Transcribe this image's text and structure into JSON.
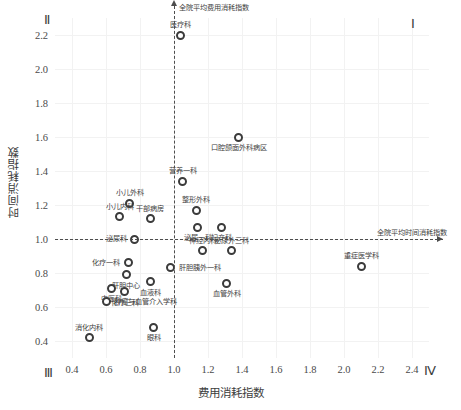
{
  "chart_data": {
    "type": "scatter",
    "title": "",
    "xlabel": "费用消耗指数",
    "ylabel": "时间消耗指数",
    "xlim": [
      0.3,
      2.5
    ],
    "ylim": [
      0.3,
      2.3
    ],
    "xticks": [
      "0.4",
      "0.6",
      "0.8",
      "1.0",
      "1.2",
      "1.4",
      "1.6",
      "1.8",
      "2.0",
      "2.2",
      "2.4"
    ],
    "xtickvalues": [
      0.4,
      0.6,
      0.8,
      1.0,
      1.2,
      1.4,
      1.6,
      1.8,
      2.0,
      2.2,
      2.4
    ],
    "yticks": [
      "0.4",
      "0.6",
      "0.8",
      "1.0",
      "1.2",
      "1.4",
      "1.6",
      "1.8",
      "2.0",
      "2.2"
    ],
    "ytickvalues": [
      0.4,
      0.6,
      0.8,
      1.0,
      1.2,
      1.4,
      1.6,
      1.8,
      2.0,
      2.2
    ],
    "grid": true,
    "legend": "none",
    "reference_lines": {
      "vertical_x": 1.0,
      "vertical_label": "全院平均费用消耗指数",
      "horizontal_y": 1.0,
      "horizontal_label": "全院平均时间消耗指数"
    },
    "quadrant_labels": {
      "top_left": "Ⅱ",
      "top_right": "Ⅰ",
      "bottom_left": "Ⅲ",
      "bottom_right": "Ⅳ"
    },
    "points": [
      {
        "label": "医疗科",
        "x": 1.04,
        "y": 2.2,
        "pos": "above"
      },
      {
        "label": "口腔颌面外科病区",
        "x": 1.38,
        "y": 1.6,
        "pos": "below"
      },
      {
        "label": "营养一科",
        "x": 1.05,
        "y": 1.34,
        "pos": "above"
      },
      {
        "label": "小儿外科",
        "x": 0.74,
        "y": 1.21,
        "pos": "above"
      },
      {
        "label": "整形外科",
        "x": 1.13,
        "y": 1.17,
        "pos": "above"
      },
      {
        "label": "小儿内科",
        "x": 0.68,
        "y": 1.13,
        "pos": "above"
      },
      {
        "label": "干部病房",
        "x": 0.86,
        "y": 1.12,
        "pos": "above"
      },
      {
        "label": "泌尿一科",
        "x": 1.14,
        "y": 1.07,
        "pos": "below"
      },
      {
        "label": "妇产科",
        "x": 1.28,
        "y": 1.07,
        "pos": "below"
      },
      {
        "label": "泌尿科",
        "x": 0.77,
        "y": 1.0,
        "pos": "left"
      },
      {
        "label": "神经内科",
        "x": 1.17,
        "y": 0.93,
        "pos": "above"
      },
      {
        "label": "泌尿外三科",
        "x": 1.34,
        "y": 0.93,
        "pos": "above"
      },
      {
        "label": "化疗一科",
        "x": 0.73,
        "y": 0.86,
        "pos": "left"
      },
      {
        "label": "肝胆胰外一科",
        "x": 0.98,
        "y": 0.83,
        "pos": "right"
      },
      {
        "label": "重症医学科",
        "x": 2.1,
        "y": 0.84,
        "pos": "above"
      },
      {
        "label": "肝胆中心",
        "x": 0.72,
        "y": 0.79,
        "pos": "below"
      },
      {
        "label": "血液科",
        "x": 0.86,
        "y": 0.75,
        "pos": "below"
      },
      {
        "label": "血管外科",
        "x": 1.31,
        "y": 0.74,
        "pos": "below"
      },
      {
        "label": "中医科",
        "x": 0.63,
        "y": 0.71,
        "pos": "below"
      },
      {
        "label": "化疗三科",
        "x": 0.71,
        "y": 0.69,
        "pos": "below"
      },
      {
        "label": "肿瘤与血管介入学科",
        "x": 0.6,
        "y": 0.63,
        "pos": "right"
      },
      {
        "label": "眼科",
        "x": 0.88,
        "y": 0.48,
        "pos": "below"
      },
      {
        "label": "消化内科",
        "x": 0.5,
        "y": 0.42,
        "pos": "above"
      }
    ]
  }
}
